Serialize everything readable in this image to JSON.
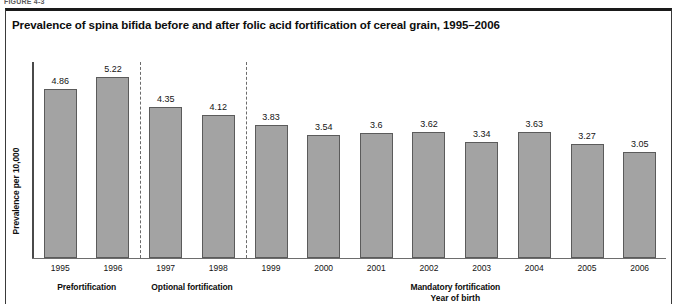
{
  "figure": {
    "number_label": "FIGURE 4-3",
    "title": "Prevalence of spina bifida before and after folic acid fortification of cereal grain, 1995–2006"
  },
  "chart_data": {
    "type": "bar",
    "title": "Prevalence of spina bifida before and after folic acid fortification of cereal grain, 1995–2006",
    "xlabel": "Year of birth",
    "ylabel": "Prevalence per 10,000",
    "categories": [
      "1995",
      "1996",
      "1997",
      "1998",
      "1999",
      "2000",
      "2001",
      "2002",
      "2003",
      "2004",
      "2005",
      "2006"
    ],
    "values": [
      4.86,
      5.22,
      4.35,
      4.12,
      3.83,
      3.54,
      3.6,
      3.62,
      3.34,
      3.63,
      3.27,
      3.05
    ],
    "value_labels": [
      "4.86",
      "5.22",
      "4.35",
      "4.12",
      "3.83",
      "3.54",
      "3.6",
      "3.62",
      "3.34",
      "3.63",
      "3.27",
      "3.05"
    ],
    "ylim": [
      0,
      5.7
    ],
    "grid": false,
    "legend": null,
    "bar_color": "#a3a3a3",
    "bar_border_color": "#5b5b5b",
    "annotations": [
      {
        "label": "Prefortification",
        "categories": [
          "1995",
          "1996"
        ]
      },
      {
        "label": "Optional fortification",
        "categories": [
          "1997",
          "1998"
        ]
      },
      {
        "label": "Mandatory fortification",
        "categories": [
          "1999",
          "2000",
          "2001",
          "2002",
          "2003",
          "2004",
          "2005",
          "2006"
        ]
      }
    ],
    "separators": [
      {
        "between": [
          "1996",
          "1997"
        ],
        "style": "dashed"
      },
      {
        "between": [
          "1998",
          "1999"
        ],
        "style": "dashed"
      }
    ]
  },
  "groups": [
    {
      "label": "Prefortification"
    },
    {
      "label": "Optional fortification"
    },
    {
      "label": "Mandatory fortification"
    }
  ],
  "axis": {
    "x_title": "Year of birth",
    "y_title": "Prevalence per 10,000"
  }
}
